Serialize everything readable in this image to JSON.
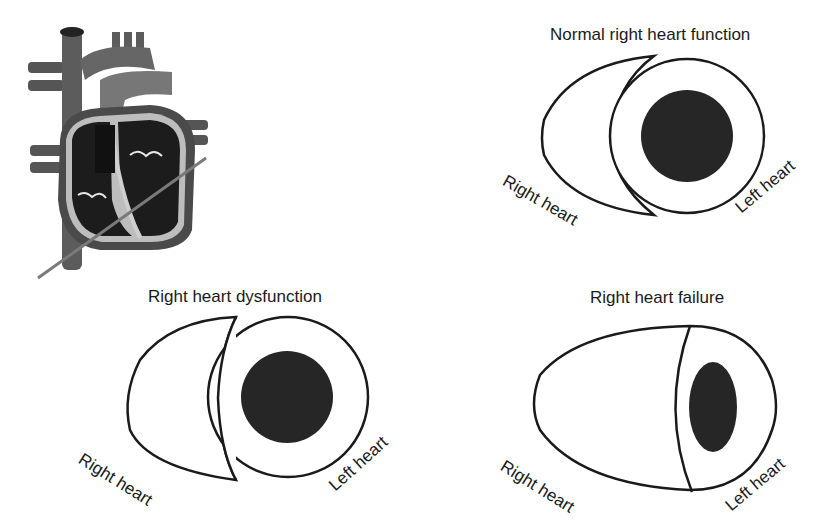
{
  "heart_illustration": {
    "name": "Cross-section anatomical heart with cutting plane line",
    "colors": {
      "vessel": "#5a5a5a",
      "chamber": "#1c1c1c",
      "wall": "#b5b5b5",
      "cut_line": "#7a7a7a"
    }
  },
  "panels": [
    {
      "id": "normal",
      "title": "Normal right heart function",
      "right_label": "Right heart",
      "left_label": "Left heart"
    },
    {
      "id": "dysfunction",
      "title": "Right heart dysfunction",
      "right_label": "Right heart",
      "left_label": "Left heart"
    },
    {
      "id": "failure",
      "title": "Right heart failure",
      "right_label": "Right heart",
      "left_label": "Left heart"
    }
  ],
  "colors": {
    "outline": "#1a1a1a",
    "lumen": "#262626",
    "background": "#ffffff"
  }
}
